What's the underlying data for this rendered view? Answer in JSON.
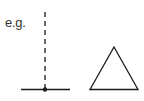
{
  "label": "e.g.",
  "colors": {
    "stroke": "#1a1a1a",
    "text": "#333333"
  },
  "figures": [
    {
      "name": "dashed-vertical-line-with-base",
      "description": "dashed vertical line meeting horizontal line at a dot"
    },
    {
      "name": "triangle",
      "description": "outline equilateral triangle"
    }
  ]
}
